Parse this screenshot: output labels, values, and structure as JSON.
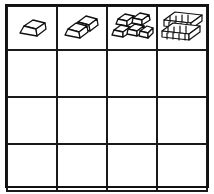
{
  "worksheet": {
    "title": "Block Stack Pattern Grid",
    "grid": {
      "columns": 4,
      "rows": 4,
      "border_color": "#111111",
      "background_color": "#ffffff",
      "line_color": "#1a1a1a"
    },
    "top_row": {
      "label": "Block stack pattern row",
      "cells": [
        {
          "index": 1,
          "icon": "block-stack-icon",
          "block_count": 1,
          "description": "one single ingot block",
          "layers": [
            1
          ]
        },
        {
          "index": 2,
          "icon": "block-stack-icon",
          "block_count": 2,
          "description": "two ingot blocks, one behind one in front",
          "layers": [
            1,
            1
          ]
        },
        {
          "index": 3,
          "icon": "block-stack-icon",
          "block_count": 5,
          "description": "pyramid stack of ingot blocks, two rows",
          "layers": [
            2,
            3
          ]
        },
        {
          "index": 4,
          "icon": "block-stack-icon",
          "block_count": 10,
          "description": "two wide rows of many thin stacked ingot blocks",
          "layers": [
            5,
            5
          ]
        }
      ]
    },
    "answer_rows": [
      {
        "index": 2,
        "label": "answer row 2",
        "cells": [
          "",
          "",
          "",
          ""
        ]
      },
      {
        "index": 3,
        "label": "answer row 3",
        "cells": [
          "",
          "",
          "",
          ""
        ]
      },
      {
        "index": 4,
        "label": "answer row 4",
        "cells": [
          "",
          "",
          "",
          ""
        ]
      }
    ]
  }
}
